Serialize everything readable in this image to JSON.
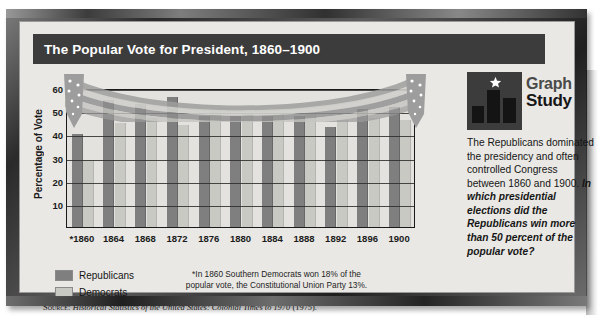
{
  "title": "The Popular Vote for President, 1860–1900",
  "chart_data": {
    "type": "bar",
    "title": "The Popular Vote for President, 1860–1900",
    "xlabel": "",
    "ylabel": "Percentage of Vote",
    "ylim": [
      0,
      60
    ],
    "yticks": [
      10,
      20,
      30,
      40,
      50,
      60
    ],
    "grid": true,
    "legend_position": "bottom-left",
    "categories": [
      "*1860",
      "1864",
      "1868",
      "1872",
      "1876",
      "1880",
      "1884",
      "1888",
      "1892",
      "1896",
      "1900"
    ],
    "series": [
      {
        "name": "Republicans",
        "color": "#7f7f7f",
        "values": [
          40,
          55,
          53,
          56,
          48,
          48,
          48,
          48,
          43,
          51,
          52
        ]
      },
      {
        "name": "Democrats",
        "color": "#c9c9c4",
        "values": [
          29,
          45,
          47,
          44,
          51,
          49,
          49,
          49,
          46,
          47,
          46
        ]
      }
    ],
    "footnote": "*In 1860 Southern Democrats won 18% of the popular vote, the Constitutional Union Party 13%.",
    "footnote_line1": "*In 1860 Southern Democrats won 18% of the",
    "footnote_line2": "popular vote, the Constitutional Union Party 13%."
  },
  "legend": {
    "items": [
      {
        "label": "Republicans",
        "color": "#7f7f7f"
      },
      {
        "label": "Democrats",
        "color": "#c9c9c4"
      }
    ]
  },
  "source": {
    "label": "Source:",
    "citation": "Historical Statistics of the United States: Colonial Times to 1970",
    "year": "(1975)."
  },
  "sidebar": {
    "logo_line1": "Graph",
    "logo_line2": "Study",
    "logo_icon": "star-and-bars-icon",
    "body_text": "The Republicans dominated the presidency and often controlled Congress between 1860 and 1900. ",
    "question_text": "In which presidential elections did the Republicans win more than 50 percent of the popular vote?"
  },
  "colors": {
    "republican": "#7f7f7f",
    "democrat": "#c9c9c4",
    "title_bar": "#3c3c3c",
    "page_bg": "#e9e8e4",
    "frame": "#2a2a2a"
  }
}
